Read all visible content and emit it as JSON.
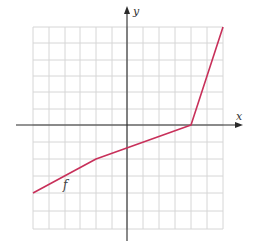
{
  "chart_data": {
    "type": "line",
    "title": "",
    "xlabel": "x",
    "ylabel": "y",
    "xlim": [
      -6,
      6
    ],
    "ylim": [
      -6,
      6
    ],
    "grid": true,
    "grid_step": 1,
    "tick_labels": false,
    "series": [
      {
        "name": "f",
        "color": "#c8305a",
        "points": [
          [
            -6,
            -4
          ],
          [
            -2,
            -2
          ],
          [
            4,
            0
          ],
          [
            6,
            6
          ]
        ]
      }
    ],
    "annotations": [
      {
        "text": "f",
        "x": -4,
        "y": -3.5
      }
    ]
  },
  "labels": {
    "x_axis": "x",
    "y_axis": "y",
    "function": "f"
  },
  "colors": {
    "line": "#c8305a",
    "grid": "#d6d6d6",
    "axis": "#2a2a2a"
  }
}
